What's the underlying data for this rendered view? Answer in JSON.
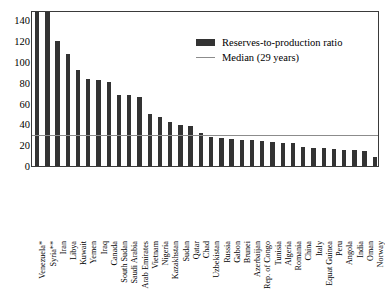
{
  "chart_data": {
    "type": "bar",
    "title": "",
    "subtitle": "",
    "xlabel": "",
    "ylabel": "",
    "ylim": [
      0,
      150
    ],
    "yticks": [
      0,
      20,
      40,
      60,
      80,
      100,
      120,
      140
    ],
    "grid": false,
    "legend_position": "upper-right",
    "categories": [
      "Venezuela*",
      "Syria**",
      "Iran",
      "Libya",
      "Kuwait",
      "Yemen",
      "Iraq",
      "Canada",
      "South Sudan",
      "Saudi Arabia",
      "Arab Emirates",
      "Vietnam",
      "Nigeria",
      "Kazakhstan",
      "Sudan",
      "Qatar",
      "Chad",
      "Uzbekistan",
      "Russia",
      "Gabon",
      "Brunei",
      "Azerbaijan",
      "Rep. of Congo",
      "Tunisia",
      "Algeria",
      "Romania",
      "China",
      "Italy",
      "Equat Guinea",
      "Peru",
      "Angola",
      "India",
      "Oman",
      "Norway"
    ],
    "series": [
      {
        "name": "Reserves-to-production ratio",
        "color": "#333333",
        "values": [
          310,
          170,
          120,
          108,
          92,
          84,
          83,
          81,
          68,
          68,
          66,
          50,
          47,
          42,
          39,
          38,
          32,
          28,
          27,
          26,
          25,
          25,
          24,
          23,
          22,
          22,
          18,
          17,
          17,
          16,
          15,
          15,
          14,
          9
        ]
      }
    ],
    "reference_lines": [
      {
        "name": "Median (29 years)",
        "value": 29,
        "color": "#8c8c8c"
      }
    ],
    "legend": [
      {
        "label": "Reserves-to-production ratio",
        "swatch": "bar",
        "color": "#333333"
      },
      {
        "label": "Median (29 years)",
        "swatch": "line",
        "color": "#8c8c8c"
      }
    ]
  }
}
